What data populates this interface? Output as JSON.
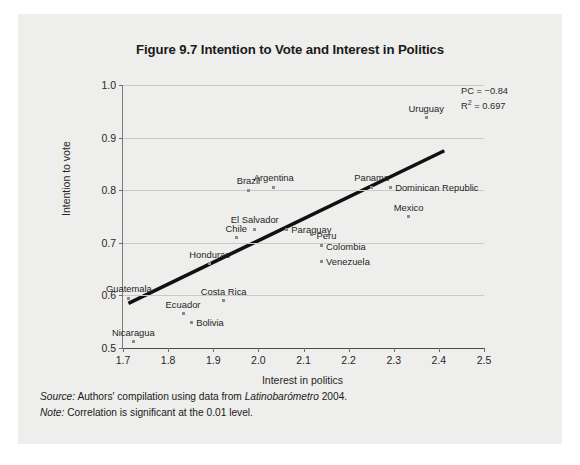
{
  "figure": {
    "title": "Figure 9.7 Intention to Vote and Interest in Politics",
    "source_label": "Source:",
    "source_text": " Authors' compilation using data from ",
    "source_italic_source": "Latinobarómetro",
    "source_year": " 2004.",
    "note_label": "Note:",
    "note_text": " Correlation is significant at the 0.01 level."
  },
  "annotations": {
    "pc_label": "PC = −0.84",
    "r2_prefix": "R",
    "r2_sup": "2",
    "r2_value": " = 0.697"
  },
  "chart_data": {
    "type": "scatter",
    "title": "Figure 9.7 Intention to Vote and Interest in Politics",
    "xlabel": "Interest in politics",
    "ylabel": "Intention to vote",
    "xlim": [
      1.7,
      2.5
    ],
    "ylim": [
      0.5,
      1.0
    ],
    "xticks": [
      "1.7",
      "1.8",
      "1.9",
      "2.0",
      "2.1",
      "2.2",
      "2.3",
      "2.4",
      "2.5"
    ],
    "xtick_values": [
      1.7,
      1.8,
      1.9,
      2.0,
      2.1,
      2.2,
      2.3,
      2.4,
      2.5
    ],
    "yticks": [
      "0.5",
      "0.6",
      "0.7",
      "0.8",
      "0.9",
      "1.0"
    ],
    "ytick_values": [
      0.5,
      0.6,
      0.7,
      0.8,
      0.9,
      1.0
    ],
    "grid": "horizontal",
    "legend": "none",
    "pearson_correlation": -0.84,
    "r_squared": 0.697,
    "marker_color": "#8a8a8a",
    "trendline_color": "#111111",
    "trendline": {
      "x": [
        1.712,
        2.412
      ],
      "y": [
        0.585,
        0.875
      ]
    },
    "points": [
      {
        "label": "Uruguay",
        "x": 2.372,
        "y": 0.938,
        "label_pos": "above"
      },
      {
        "label": "Brazil",
        "x": 1.978,
        "y": 0.8,
        "label_pos": "above"
      },
      {
        "label": "Argentina",
        "x": 2.034,
        "y": 0.806,
        "label_pos": "above"
      },
      {
        "label": "Panama",
        "x": 2.251,
        "y": 0.806,
        "label_pos": "above"
      },
      {
        "label": "Dominican Republic",
        "x": 2.292,
        "y": 0.806,
        "label_pos": "right"
      },
      {
        "label": "Mexico",
        "x": 2.333,
        "y": 0.75,
        "label_pos": "above"
      },
      {
        "label": "El Salvador",
        "x": 1.992,
        "y": 0.726,
        "label_pos": "above"
      },
      {
        "label": "Paraguay",
        "x": 2.062,
        "y": 0.726,
        "label_pos": "right"
      },
      {
        "label": "Chile",
        "x": 1.951,
        "y": 0.71,
        "label_pos": "above"
      },
      {
        "label": "Peru",
        "x": 2.118,
        "y": 0.715,
        "label_pos": "right"
      },
      {
        "label": "Colombia",
        "x": 2.139,
        "y": 0.694,
        "label_pos": "right"
      },
      {
        "label": "Venezuela",
        "x": 2.139,
        "y": 0.665,
        "label_pos": "right"
      },
      {
        "label": "Honduras",
        "x": 1.892,
        "y": 0.66,
        "label_pos": "above"
      },
      {
        "label": "Guatemala",
        "x": 1.713,
        "y": 0.595,
        "label_pos": "above"
      },
      {
        "label": "Costa Rica",
        "x": 1.923,
        "y": 0.59,
        "label_pos": "above"
      },
      {
        "label": "Ecuador",
        "x": 1.833,
        "y": 0.565,
        "label_pos": "above"
      },
      {
        "label": "Bolivia",
        "x": 1.851,
        "y": 0.549,
        "label_pos": "right"
      },
      {
        "label": "Nicaragua",
        "x": 1.723,
        "y": 0.512,
        "label_pos": "above"
      }
    ]
  }
}
